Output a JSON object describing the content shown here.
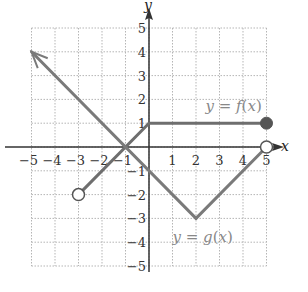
{
  "chart_data": {
    "type": "line",
    "title": "",
    "xlabel": "x",
    "ylabel": "y",
    "xlim": [
      -5,
      5
    ],
    "ylim": [
      -5,
      5
    ],
    "grid": true,
    "x_ticks": [
      "−5",
      "−4",
      "−3",
      "−2",
      "−1",
      "1",
      "2",
      "3",
      "4",
      "5"
    ],
    "y_ticks": [
      "5",
      "4",
      "3",
      "2",
      "1",
      "−1",
      "−2",
      "−3",
      "−4",
      "−5"
    ],
    "series": [
      {
        "name": "y = f(x)",
        "label_parts": [
          "y",
          " = ",
          "f",
          "(",
          "x",
          ")"
        ],
        "color": "#6e6e6e",
        "segments": [
          {
            "points": [
              [
                -3,
                -2
              ],
              [
                0,
                1
              ]
            ],
            "start": "open",
            "end": "none"
          },
          {
            "points": [
              [
                0,
                1
              ],
              [
                5,
                1
              ]
            ],
            "start": "none",
            "end": "closed"
          }
        ]
      },
      {
        "name": "y = g(x)",
        "label_parts": [
          "y",
          " = ",
          "g",
          "(",
          "x",
          ")"
        ],
        "color": "#7a7a7a",
        "segments": [
          {
            "points": [
              [
                -5,
                4
              ],
              [
                2,
                -3
              ]
            ],
            "start": "arrow",
            "end": "none"
          },
          {
            "points": [
              [
                2,
                -3
              ],
              [
                5,
                0
              ]
            ],
            "start": "none",
            "end": "open"
          }
        ]
      }
    ],
    "annotations": [
      {
        "text": "y = f(x)",
        "x": 2.4,
        "y": 1.5
      },
      {
        "text": "y = g(x)",
        "x": 1.0,
        "y": -4.0
      }
    ]
  },
  "colors": {
    "axis": "#333333",
    "grid": "#b5b5b5",
    "curve": "#777777"
  }
}
